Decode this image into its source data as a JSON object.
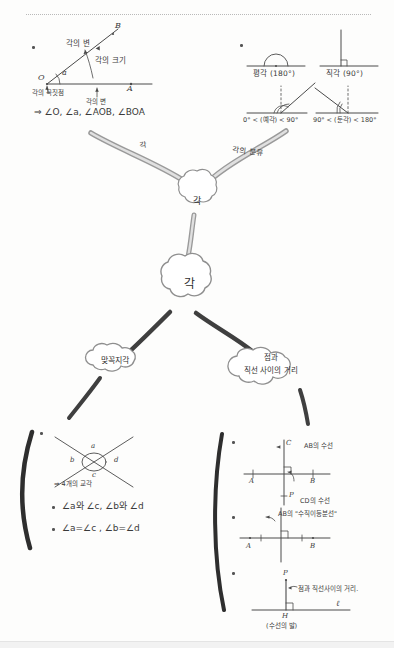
{
  "page": {
    "title_note": "각 (Angle) handwritten mind map",
    "ink_color": "#3a3a3a",
    "branch_color": "#8c8c8c",
    "branch_dark_color": "#4a4a4a",
    "paper_color": "#fdfdfc"
  },
  "top_left_diagram": {
    "caption_side_upper": "각의 변",
    "caption_angle_size": "각의 크기",
    "caption_vertex": "각의 꼭짓점",
    "caption_side_lower": "각의 변",
    "point_o": "O",
    "point_a": "A",
    "point_b": "B",
    "angle_symbol": "a",
    "notation_line": "⇒ ∠O, ∠a, ∠AOB, ∠BOA"
  },
  "top_right_diagram": {
    "straight_angle": "평각 (180°)",
    "right_angle": "직각 (90°)",
    "acute_angle": "0° < (예각) < 90°",
    "obtuse_angle": "90° < (둔각) < 180°"
  },
  "branch_labels": {
    "left_top": "각",
    "right_top": "각의 분류"
  },
  "bubbles": {
    "center_upper": "각",
    "center_lower": "각",
    "left_lower": "맞꼭지각",
    "right_lower_line1": "점과",
    "right_lower_line2": "직선 사이의 거리"
  },
  "vertical_angles_diagram": {
    "label_a": "a",
    "label_b": "b",
    "label_c": "c",
    "label_d": "d",
    "note": "⇒ 4개의 교각",
    "pair_line": "∠a와 ∠c,  ∠b와 ∠d",
    "equality_line": "∠a=∠c ,  ∠b=∠d"
  },
  "perpendicular_diagram": {
    "point_a": "A",
    "point_b": "B",
    "point_c": "C",
    "point_p": "P",
    "label_ab_perp": "AB의 수선",
    "label_cd_perp": "CD의 수선"
  },
  "bisector_diagram": {
    "point_a": "A",
    "point_b": "B",
    "label": "AB의 \"수직이등분선\""
  },
  "distance_diagram": {
    "point_p": "P",
    "point_h": "H",
    "line_label": "ℓ",
    "label_distance": "점과 직선사이의 거리.",
    "label_foot": "(수선의 발)"
  }
}
